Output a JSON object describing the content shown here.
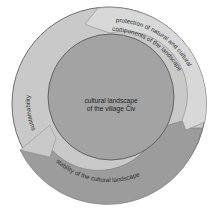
{
  "diagram": {
    "center": {
      "line1": "cultural landscape",
      "line2": "of the village Čiv"
    },
    "segments": [
      {
        "id": "left",
        "label": "sustainability",
        "color": "#c9c9c9"
      },
      {
        "id": "upper-right",
        "label_line1": "protection of natural and cultural",
        "label_line2": "components of the landscape",
        "color": "#d6d6d6"
      },
      {
        "id": "bottom",
        "label": "stability of the cultural landscape",
        "color": "#9c9c9c"
      }
    ],
    "colors": {
      "outer_stroke": "#6e6e6e",
      "inner_circle": "#a3a3a3",
      "inner_stroke": "#5a5a5a",
      "background": "#ffffff"
    }
  }
}
